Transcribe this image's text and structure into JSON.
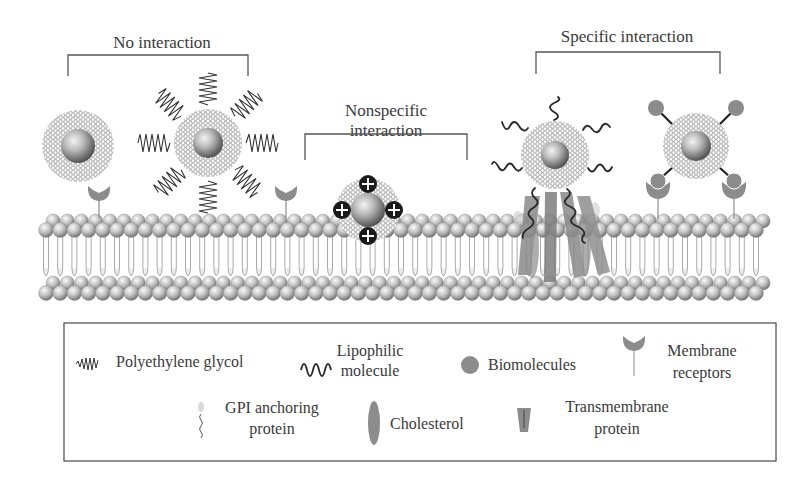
{
  "diagram": {
    "type": "nanoparticle-membrane-interaction",
    "groups": [
      {
        "id": "no-interaction",
        "label": "No interaction"
      },
      {
        "id": "nonspecific",
        "label_line1": "Nonspecific",
        "label_line2": "interaction"
      },
      {
        "id": "specific",
        "label": "Specific interaction"
      }
    ],
    "particles": [
      {
        "id": "bare",
        "coating": "none"
      },
      {
        "id": "pegylated",
        "coating": "Polyethylene glycol"
      },
      {
        "id": "cationic",
        "coating": "positive charges",
        "charge_symbol": "+"
      },
      {
        "id": "lipophilic",
        "coating": "Lipophilic molecule"
      },
      {
        "id": "targeted",
        "coating": "Biomolecules"
      }
    ],
    "membrane": {
      "name": "lipid bilayer"
    }
  },
  "legend": {
    "items": [
      {
        "icon": "peg-icon",
        "line1": "Polyethylene glycol",
        "line2": ""
      },
      {
        "icon": "lipophilic-icon",
        "line1": "Lipophilic",
        "line2": "molecule"
      },
      {
        "icon": "biomolecule-icon",
        "line1": "Biomolecules",
        "line2": ""
      },
      {
        "icon": "receptor-icon",
        "line1": "Membrane",
        "line2": "receptors"
      },
      {
        "icon": "gpi-icon",
        "line1": "GPI anchoring",
        "line2": "protein"
      },
      {
        "icon": "cholesterol-icon",
        "line1": "Cholesterol",
        "line2": ""
      },
      {
        "icon": "transmembrane-icon",
        "line1": "Transmembrane",
        "line2": "protein"
      }
    ]
  },
  "colors": {
    "text": "#3a3a3a",
    "bracket": "#555555",
    "grey_component": "#8c8c8c",
    "core_light": "#e8e8e8",
    "core_dark": "#7a7a7a",
    "shell": "#9a9a9a",
    "charge": "#1a1a1a"
  }
}
